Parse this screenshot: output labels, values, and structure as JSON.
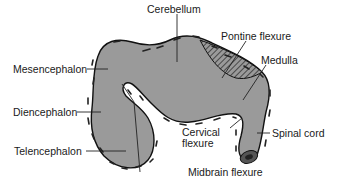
{
  "diagram": {
    "colors": {
      "tissue": "#9a9a9a",
      "outline": "#111111",
      "background": "#ffffff",
      "hatch": "#333333"
    },
    "labels": {
      "cerebellum": "Cerebellum",
      "pontine_flexure": "Pontine flexure",
      "medulla": "Medulla",
      "mesencephalon": "Mesencephalon",
      "diencephalon": "Diencephalon",
      "telencephalon": "Telencephalon",
      "cervical_flexure_line1": "Cervical",
      "cervical_flexure_line2": "flexure",
      "spinal_cord": "Spinal cord",
      "midbrain_flexure": "Midbrain flexure"
    }
  }
}
